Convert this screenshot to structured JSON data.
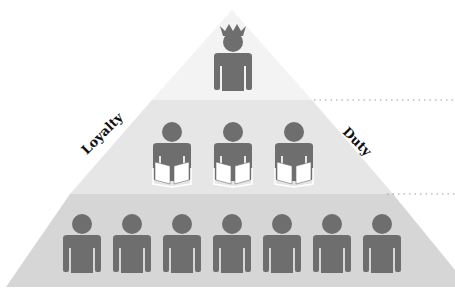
{
  "diagram": {
    "title": "",
    "type": "hierarchy-pyramid",
    "colors": {
      "tier_top": "#f3f3f3",
      "tier_middle": "#e6e6e6",
      "tier_bottom": "#d6d6d6",
      "figure": "#6e6e6e",
      "book": "#ffffff",
      "dotted_line": "#9a9a9a",
      "label_text": "#111111"
    },
    "side_labels": {
      "left": "Loyalty",
      "right": "Duty"
    },
    "tiers": [
      {
        "name": "top",
        "figure_count": 1,
        "figure_type": "person-with-crown"
      },
      {
        "name": "middle",
        "figure_count": 3,
        "figure_type": "person-reading-book"
      },
      {
        "name": "bottom",
        "figure_count": 7,
        "figure_type": "person"
      }
    ]
  }
}
